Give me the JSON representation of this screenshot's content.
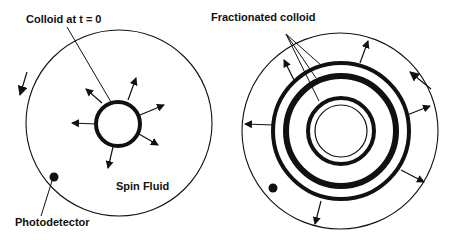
{
  "figure": {
    "left_panel": {
      "title": "Colloid at t = 0",
      "fluid_label": "Spin Fluid",
      "detector_label": "Photodetector"
    },
    "right_panel": {
      "title": "Fractionated colloid"
    }
  },
  "colors": {
    "stroke": "#111111",
    "background": "#ffffff"
  }
}
